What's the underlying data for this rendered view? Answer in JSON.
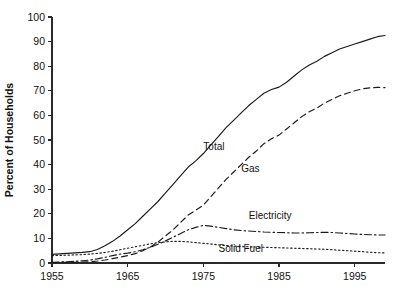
{
  "chart_data": {
    "type": "line",
    "title": "",
    "xlabel": "",
    "ylabel": "Percent of Households",
    "xlim": [
      1955,
      1999
    ],
    "ylim": [
      0,
      100
    ],
    "grid": false,
    "legend_position": "inline-labels",
    "x_ticks": [
      1955,
      1965,
      1975,
      1985,
      1995
    ],
    "x_tick_labels": [
      "1955",
      "1965",
      "1975",
      "1985",
      "1995"
    ],
    "y_ticks": [
      0,
      10,
      20,
      30,
      40,
      50,
      60,
      70,
      80,
      90,
      100
    ],
    "y_tick_labels": [
      "0",
      "10",
      "20",
      "30",
      "40",
      "50",
      "60",
      "70",
      "80",
      "90",
      "100"
    ],
    "x": [
      1955,
      1956,
      1957,
      1958,
      1959,
      1960,
      1961,
      1962,
      1963,
      1964,
      1965,
      1966,
      1967,
      1968,
      1969,
      1970,
      1971,
      1972,
      1973,
      1974,
      1975,
      1976,
      1977,
      1978,
      1979,
      1980,
      1981,
      1982,
      1983,
      1984,
      1985,
      1986,
      1987,
      1988,
      1989,
      1990,
      1991,
      1992,
      1993,
      1994,
      1995,
      1996,
      1997,
      1998,
      1999
    ],
    "series": [
      {
        "name": "Total",
        "style": "solid",
        "label": "Total",
        "label_x": 1975,
        "label_y": 46,
        "values": [
          3.5,
          3.7,
          3.9,
          4.1,
          4.3,
          4.6,
          5.5,
          7.0,
          8.8,
          11.0,
          13.5,
          16.0,
          19.0,
          22.0,
          25.0,
          28.5,
          32.0,
          35.5,
          39.0,
          41.5,
          44.5,
          48.0,
          51.5,
          55.0,
          58.0,
          61.0,
          64.0,
          66.5,
          69.0,
          70.5,
          71.5,
          73.5,
          76.0,
          78.5,
          80.5,
          82.0,
          84.0,
          85.5,
          87.0,
          88.0,
          89.0,
          90.0,
          91.0,
          92.0,
          92.5
        ]
      },
      {
        "name": "Gas",
        "style": "dashed",
        "label": "Gas",
        "label_x": 1980,
        "label_y": 37,
        "values": [
          0.2,
          0.2,
          0.3,
          0.3,
          0.4,
          0.5,
          0.8,
          1.2,
          1.8,
          2.4,
          3.0,
          3.8,
          5.0,
          6.5,
          8.5,
          11.0,
          13.5,
          16.5,
          19.5,
          21.5,
          23.5,
          27.0,
          30.5,
          34.0,
          37.0,
          40.0,
          43.0,
          45.5,
          48.5,
          50.5,
          52.0,
          54.5,
          57.0,
          59.5,
          61.5,
          63.0,
          65.0,
          66.5,
          68.0,
          69.0,
          70.0,
          70.8,
          71.2,
          71.4,
          71.3
        ]
      },
      {
        "name": "Electricity",
        "style": "dash-dot",
        "label": "Electricity",
        "label_x": 1981,
        "label_y": 18,
        "values": [
          0.3,
          0.4,
          0.5,
          0.7,
          0.9,
          1.2,
          1.7,
          2.3,
          3.0,
          3.6,
          4.0,
          4.6,
          5.4,
          6.4,
          7.6,
          9.0,
          10.5,
          12.0,
          13.5,
          14.5,
          15.3,
          15.0,
          14.5,
          14.0,
          13.5,
          13.2,
          13.0,
          12.8,
          12.6,
          12.5,
          12.4,
          12.3,
          12.2,
          12.2,
          12.3,
          12.4,
          12.5,
          12.4,
          12.2,
          12.0,
          11.8,
          11.6,
          11.5,
          11.4,
          11.4
        ]
      },
      {
        "name": "Solid Fuel",
        "style": "dotted",
        "label": "Solid Fuel",
        "label_x": 1977,
        "label_y": 4.5,
        "values": [
          3.0,
          3.1,
          3.2,
          3.3,
          3.4,
          3.6,
          3.9,
          4.3,
          4.8,
          5.4,
          6.0,
          6.6,
          7.2,
          7.8,
          8.3,
          8.6,
          8.8,
          8.8,
          8.6,
          8.3,
          8.0,
          7.7,
          7.4,
          7.1,
          6.9,
          6.7,
          6.6,
          6.5,
          6.4,
          6.3,
          6.2,
          6.1,
          6.0,
          5.9,
          5.8,
          5.7,
          5.6,
          5.4,
          5.2,
          5.0,
          4.8,
          4.6,
          4.4,
          4.2,
          4.1
        ]
      }
    ]
  },
  "style": {
    "line_color": "#1a1a1a",
    "axis_color": "#2b2b2b",
    "text_color": "#111111",
    "background": "#ffffff"
  }
}
